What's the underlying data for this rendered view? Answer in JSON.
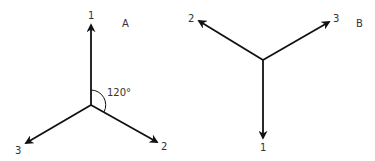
{
  "diagrams": [
    {
      "id": "A",
      "label": "A",
      "angle_label": "120°",
      "arrows": [
        {
          "label": "1",
          "direction": "up"
        },
        {
          "label": "2",
          "direction": "down-right"
        },
        {
          "label": "3",
          "direction": "down-left"
        }
      ]
    },
    {
      "id": "B",
      "label": "B",
      "arrows": [
        {
          "label": "1",
          "direction": "down"
        },
        {
          "label": "2",
          "direction": "up-left"
        },
        {
          "label": "3",
          "direction": "up-right"
        }
      ]
    }
  ],
  "colors": {
    "stroke": "#111111",
    "text": "#333333"
  }
}
